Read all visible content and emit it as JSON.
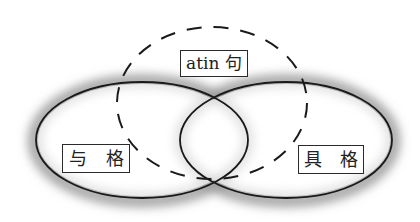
{
  "diagram": {
    "type": "venn",
    "colors": {
      "stroke": "#1a1a1a",
      "shadow": "#7a7a7a",
      "label_border": "#2a2a2a",
      "background": "#ffffff"
    },
    "sets": {
      "top": {
        "label": "atin 句",
        "style": "dashed"
      },
      "left": {
        "label_part1": "与",
        "label_part2": "格",
        "style": "solid"
      },
      "right": {
        "label_part1": "具",
        "label_part2": "格",
        "style": "solid"
      }
    }
  }
}
